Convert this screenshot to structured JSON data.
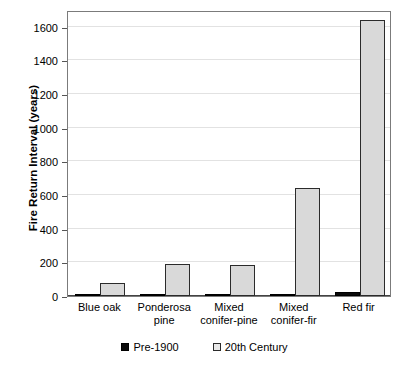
{
  "chart_data": {
    "type": "bar",
    "title": "",
    "subtitle": "",
    "xlabel": "",
    "ylabel": "Fire Return Interval (years)",
    "categories": [
      "Blue oak",
      "Ponderosa pine",
      "Mixed conifer-pine",
      "Mixed conifer-fir",
      "Red fir"
    ],
    "category_lines": [
      [
        "Blue oak"
      ],
      [
        "Ponderosa",
        "pine"
      ],
      [
        "Mixed",
        "conifer-pine"
      ],
      [
        "Mixed",
        "conifer-fir"
      ],
      [
        "Red fir"
      ]
    ],
    "series": [
      {
        "name": "Pre-1900",
        "values": [
          5,
          8,
          11,
          12,
          26
        ],
        "fill": "solid-black",
        "color": "#0a0a0a"
      },
      {
        "name": "20th Century",
        "values": [
          75,
          190,
          185,
          640,
          1640
        ],
        "fill": "dotted-hatch",
        "color": "#d9d9d9"
      }
    ],
    "ylim": [
      0,
      1700
    ],
    "yticks": [
      0,
      200,
      400,
      600,
      800,
      1000,
      1200,
      1400,
      1600
    ],
    "ytick_labels": [
      "0",
      "200",
      "400",
      "600",
      "800",
      "1000",
      "1200",
      "1400",
      "1600"
    ],
    "grid": true,
    "grid_axis": "y",
    "legend_position": "bottom-center",
    "legend_entries": [
      "Pre-1900",
      "20th Century"
    ],
    "plot_background": "#ffffff",
    "grid_color": "#e2e2e2",
    "frame_color": "#7b7b7b"
  }
}
